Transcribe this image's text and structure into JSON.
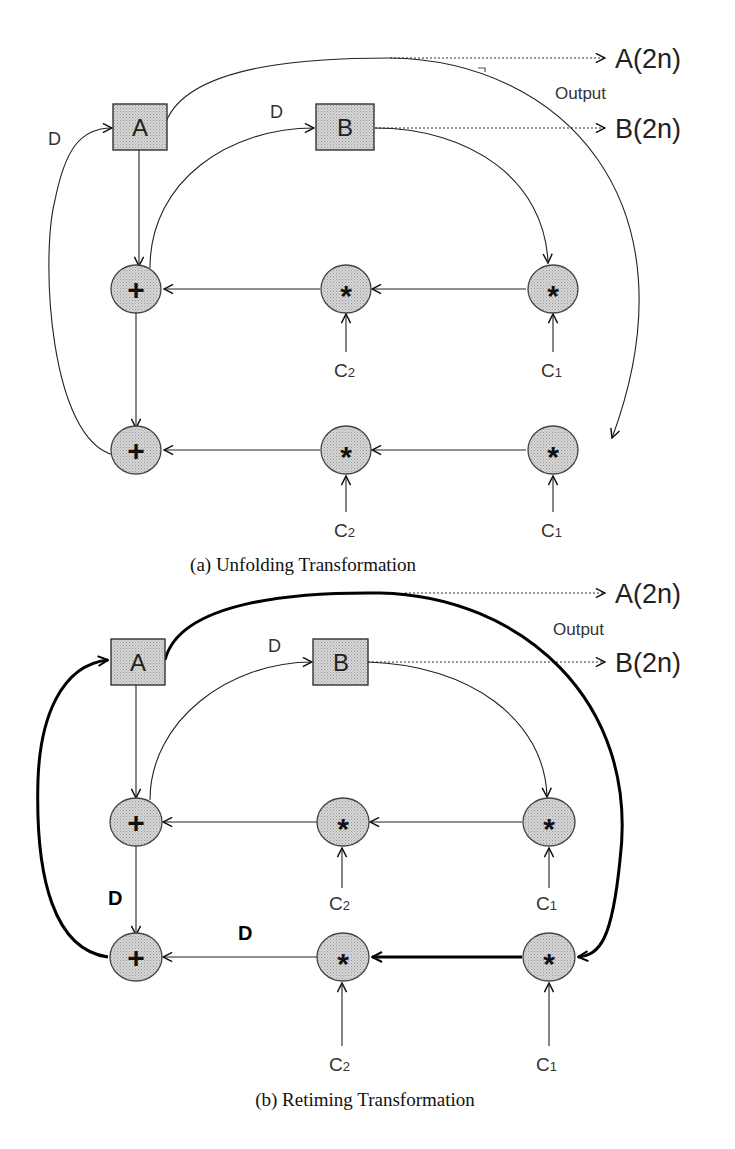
{
  "figure": {
    "panel_a": {
      "caption": "(a) Unfolding Transformation",
      "nodes": {
        "A": "A",
        "B": "B",
        "add1": "+",
        "add2": "+",
        "mul_c2_top": "*",
        "mul_c1_top": "*",
        "mul_c2_bot": "*",
        "mul_c1_bot": "*"
      },
      "inputs": {
        "c2_top": {
          "base": "C",
          "sub": "2"
        },
        "c1_top": {
          "base": "C",
          "sub": "1"
        },
        "c2_bot": {
          "base": "C",
          "sub": "2"
        },
        "c1_bot": {
          "base": "C",
          "sub": "1"
        }
      },
      "delays": {
        "feedback_to_A": "D",
        "to_B": "D"
      },
      "outputs": {
        "label": "Output",
        "a": "A(2n)",
        "b": "B(2n)"
      }
    },
    "panel_b": {
      "caption": "(b) Retiming Transformation",
      "nodes": {
        "A": "A",
        "B": "B",
        "add1": "+",
        "add2": "+",
        "mul_c2_top": "*",
        "mul_c1_top": "*",
        "mul_c2_bot": "*",
        "mul_c1_bot": "*"
      },
      "inputs": {
        "c2_top": {
          "base": "C",
          "sub": "2"
        },
        "c1_top": {
          "base": "C",
          "sub": "1"
        },
        "c2_bot": {
          "base": "C",
          "sub": "2"
        },
        "c1_bot": {
          "base": "C",
          "sub": "1"
        }
      },
      "delays": {
        "to_B": "D",
        "add1_to_add2": "D",
        "mul_to_add2": "D"
      },
      "outputs": {
        "label": "Output",
        "a": "A(2n)",
        "b": "B(2n)"
      }
    }
  }
}
